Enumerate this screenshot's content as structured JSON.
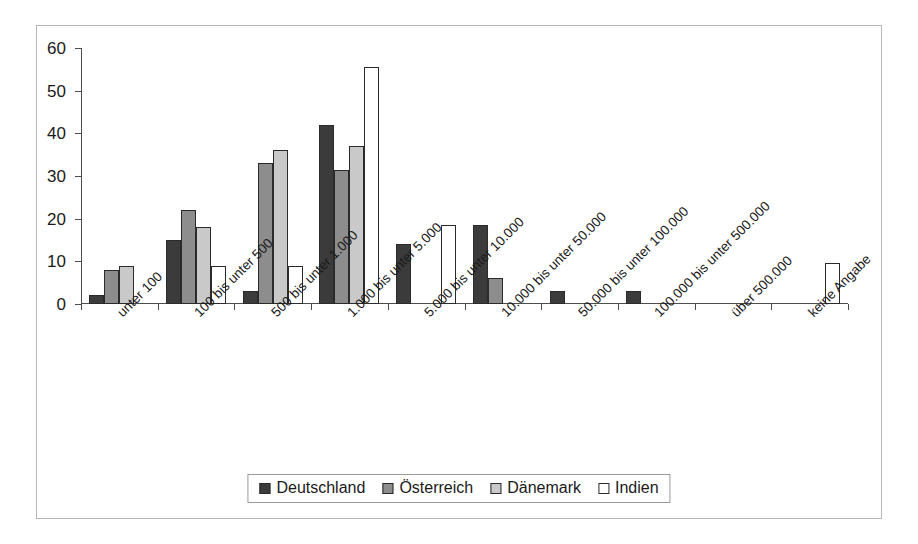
{
  "chart_data": {
    "type": "bar",
    "title": "",
    "subtitle": "",
    "xlabel": "",
    "ylabel": "",
    "ylim": [
      0,
      60
    ],
    "yticks": [
      0,
      10,
      20,
      30,
      40,
      50,
      60
    ],
    "ytick_labels": [
      "0",
      "10",
      "20",
      "30",
      "40",
      "50",
      "60"
    ],
    "grid": false,
    "legend_position": "bottom",
    "categories": [
      "unter 100",
      "100 bis unter 500",
      "500 bis unter 1.000",
      "1.000 bis unter 5.000",
      "5.000 bis unter 10.000",
      "10.000 bis unter 50.000",
      "50.000 bis unter 100.000",
      "100.000 bis unter 500.000",
      "über 500.000",
      "keine Angabe"
    ],
    "series": [
      {
        "name": "Deutschland",
        "color": "#3b3b3b",
        "values": [
          2,
          15,
          3,
          42,
          14,
          18.5,
          3,
          3,
          0,
          0
        ]
      },
      {
        "name": "Österreich",
        "color": "#8d8d8d",
        "values": [
          8,
          22,
          33,
          31.5,
          0,
          6,
          0,
          0,
          0,
          0
        ]
      },
      {
        "name": "Dänemark",
        "color": "#c9c9c9",
        "values": [
          9,
          18,
          36,
          37,
          0,
          0,
          0,
          0,
          0,
          0
        ]
      },
      {
        "name": "Indien",
        "color": "#ffffff",
        "values": [
          0,
          9,
          9,
          55.5,
          18.5,
          0,
          0,
          0,
          0,
          9.5
        ]
      }
    ]
  },
  "legend": {
    "items": [
      {
        "label": "Deutschland",
        "color": "#3b3b3b"
      },
      {
        "label": "Österreich",
        "color": "#8d8d8d"
      },
      {
        "label": "Dänemark",
        "color": "#c9c9c9"
      },
      {
        "label": "Indien",
        "color": "#ffffff"
      }
    ]
  }
}
